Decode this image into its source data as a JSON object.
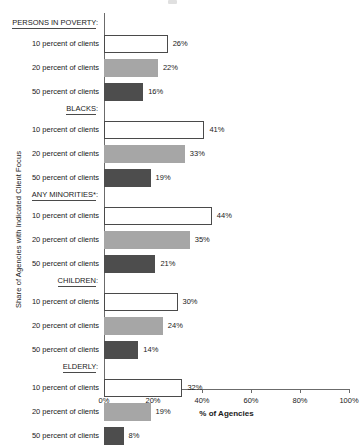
{
  "chart_data": {
    "type": "bar",
    "orientation": "horizontal",
    "title": "",
    "xlabel": "% of Agencies",
    "ylabel": "Share of Agencies with Indicated Client Focus",
    "xlim": [
      0,
      100
    ],
    "xticks": [
      "0%",
      "20%",
      "40%",
      "60%",
      "80%",
      "100%"
    ],
    "xtick_values": [
      0,
      20,
      40,
      60,
      80,
      100
    ],
    "grid": false,
    "legend": "none",
    "series": [
      {
        "name": "10 percent of clients",
        "style": "white-outline",
        "values": [
          26,
          41,
          44,
          30,
          32
        ]
      },
      {
        "name": "20 percent of clients",
        "style": "medium-gray",
        "values": [
          22,
          33,
          35,
          24,
          19
        ]
      },
      {
        "name": "50 percent of clients",
        "style": "dark-gray",
        "values": [
          16,
          19,
          21,
          14,
          8
        ]
      }
    ],
    "categories": [
      "PERSONS IN POVERTY:",
      "BLACKS:",
      "ANY MINORITIES*:",
      "CHILDREN:",
      "ELDERLY:"
    ],
    "groups": [
      {
        "header": "PERSONS IN POVERTY:",
        "header_text": "PERSONS IN POVERTY",
        "bars": [
          {
            "label": "10 percent of clients",
            "value": 26,
            "value_label": "26%",
            "style": "s10"
          },
          {
            "label": "20 percent of clients",
            "value": 22,
            "value_label": "22%",
            "style": "s20"
          },
          {
            "label": "50 percent of clients",
            "value": 16,
            "value_label": "16%",
            "style": "s50"
          }
        ]
      },
      {
        "header": "BLACKS:",
        "header_text": "BLACKS",
        "bars": [
          {
            "label": "10 percent of clients",
            "value": 41,
            "value_label": "41%",
            "style": "s10"
          },
          {
            "label": "20 percent of clients",
            "value": 33,
            "value_label": "33%",
            "style": "s20"
          },
          {
            "label": "50 percent of clients",
            "value": 19,
            "value_label": "19%",
            "style": "s50"
          }
        ]
      },
      {
        "header": "ANY MINORITIES*:",
        "header_text": "ANY MINORITIES*",
        "bars": [
          {
            "label": "10 percent of clients",
            "value": 44,
            "value_label": "44%",
            "style": "s10"
          },
          {
            "label": "20 percent of clients",
            "value": 35,
            "value_label": "35%",
            "style": "s20"
          },
          {
            "label": "50 percent of clients",
            "value": 21,
            "value_label": "21%",
            "style": "s50"
          }
        ]
      },
      {
        "header": "CHILDREN:",
        "header_text": "CHILDREN",
        "bars": [
          {
            "label": "10 percent of clients",
            "value": 30,
            "value_label": "30%",
            "style": "s10"
          },
          {
            "label": "20 percent of clients",
            "value": 24,
            "value_label": "24%",
            "style": "s20"
          },
          {
            "label": "50 percent of clients",
            "value": 14,
            "value_label": "14%",
            "style": "s50"
          }
        ]
      },
      {
        "header": "ELDERLY:",
        "header_text": "ELDERLY",
        "bars": [
          {
            "label": "10 percent of clients",
            "value": 32,
            "value_label": "32%",
            "style": "s10"
          },
          {
            "label": "20 percent of clients",
            "value": 19,
            "value_label": "19%",
            "style": "s20"
          },
          {
            "label": "50 percent of clients",
            "value": 8,
            "value_label": "8%",
            "style": "s50"
          }
        ]
      }
    ],
    "colors": {
      "bar_10_fill": "#ffffff",
      "bar_10_border": "#4a4a4a",
      "bar_20_fill": "#a6a6a6",
      "bar_50_fill": "#4d4d4d",
      "axis": "#6b6b6b",
      "text": "#1a1a1a"
    }
  }
}
